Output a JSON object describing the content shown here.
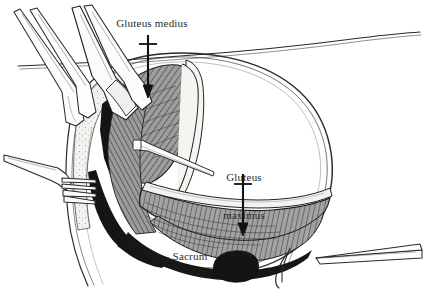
{
  "figure": {
    "kind": "anatomical-surgical-illustration",
    "background_color": "#ffffff",
    "ink_color": "#1a1a1a",
    "label_color": "#2b2b2b",
    "muscle_fill_color": "#9a9a9a",
    "shadow_fill_color": "#121212",
    "fascia_fill_color": "#f2f0ec",
    "sacrum_fill_color": "#1a1a1a",
    "width": 424,
    "height": 294
  },
  "labels": {
    "gluteus_medius": "Gluteus medius",
    "gluteus_maximus_line1": "Gluteus",
    "gluteus_maximus_line2": "maximus",
    "sacrum": "Sacrum"
  },
  "annotations": [
    {
      "id": "gluteus-medius",
      "text": "Gluteus medius",
      "arrow": "down",
      "arrow_x": 148,
      "arrow_from_y": 36,
      "arrow_to_y": 96
    },
    {
      "id": "gluteus-maximus",
      "text": "Gluteus maximus",
      "arrow": "down",
      "arrow_x": 243,
      "arrow_from_y": 175,
      "arrow_to_y": 234
    },
    {
      "id": "sacrum",
      "text": "Sacrum",
      "arrow": "none"
    }
  ],
  "instruments": [
    {
      "id": "retractor-upper-left-a",
      "name": "self-retaining-retractor-blade"
    },
    {
      "id": "retractor-upper-left-b",
      "name": "self-retaining-retractor-blade"
    },
    {
      "id": "rake-retractor-left",
      "name": "four-prong-rake-retractor"
    },
    {
      "id": "probe-elevator-center",
      "name": "periosteal-elevator-probe"
    },
    {
      "id": "forceps-lower-right",
      "name": "tapered-forceps-tip"
    }
  ],
  "structures": [
    {
      "id": "gluteus-medius-muscle",
      "name": "gluteus medius"
    },
    {
      "id": "gluteus-maximus-muscle",
      "name": "gluteus maximus"
    },
    {
      "id": "sacrum-bone",
      "name": "sacrum"
    },
    {
      "id": "skin-contour",
      "name": "skin and subcutaneous contour"
    },
    {
      "id": "deep-shadow-wedge",
      "name": "deep wound shadow"
    }
  ]
}
